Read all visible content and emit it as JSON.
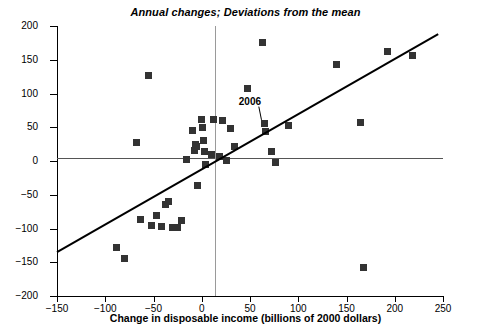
{
  "chart_data": {
    "type": "scatter",
    "title": "Annual changes; Deviations from the mean",
    "xlabel": "Change in disposable income (billions of 2000 dollars)",
    "ylabel": "Change in consumption (billions of 2000 dollars)",
    "xlim": [
      -150,
      250
    ],
    "ylim": [
      -200,
      200
    ],
    "xticks": [
      -150,
      -100,
      -50,
      0,
      50,
      100,
      150,
      200,
      250
    ],
    "yticks": [
      -200,
      -150,
      -100,
      -50,
      0,
      50,
      100,
      150,
      200
    ],
    "xtick_labels": [
      "−150",
      "−100",
      "−50",
      "0",
      "50",
      "100",
      "150",
      "200",
      "250"
    ],
    "ytick_labels": [
      "−200",
      "−150",
      "−100",
      "−50",
      "0",
      "50",
      "100",
      "150",
      "200"
    ],
    "grid": false,
    "legend": false,
    "zero_lines": {
      "horizontal": 0,
      "vertical": 0
    },
    "points": [
      {
        "x": -88,
        "y": -128
      },
      {
        "x": -80,
        "y": -145
      },
      {
        "x": -68,
        "y": 28
      },
      {
        "x": -63,
        "y": -87
      },
      {
        "x": -55,
        "y": 127
      },
      {
        "x": -52,
        "y": -96
      },
      {
        "x": -47,
        "y": -81
      },
      {
        "x": -42,
        "y": -97
      },
      {
        "x": -38,
        "y": -65
      },
      {
        "x": -34,
        "y": -60
      },
      {
        "x": -30,
        "y": -98
      },
      {
        "x": -25,
        "y": -99
      },
      {
        "x": -21,
        "y": -88
      },
      {
        "x": -16,
        "y": 2
      },
      {
        "x": -10,
        "y": 45
      },
      {
        "x": -8,
        "y": 16
      },
      {
        "x": -6,
        "y": 24
      },
      {
        "x": -5,
        "y": 22
      },
      {
        "x": -4,
        "y": -37
      },
      {
        "x": 0,
        "y": 62
      },
      {
        "x": 1,
        "y": 49
      },
      {
        "x": 2,
        "y": 31
      },
      {
        "x": 3,
        "y": 14
      },
      {
        "x": 4,
        "y": -5
      },
      {
        "x": 10,
        "y": 9
      },
      {
        "x": 12,
        "y": 62
      },
      {
        "x": 18,
        "y": 6
      },
      {
        "x": 22,
        "y": 60
      },
      {
        "x": 26,
        "y": 1
      },
      {
        "x": 30,
        "y": 48
      },
      {
        "x": 34,
        "y": 21
      },
      {
        "x": 47,
        "y": 107
      },
      {
        "x": 63,
        "y": 175
      },
      {
        "x": 65,
        "y": 55
      },
      {
        "x": 66,
        "y": 44
      },
      {
        "x": 72,
        "y": 14
      },
      {
        "x": 76,
        "y": -2
      },
      {
        "x": 90,
        "y": 52
      },
      {
        "x": 140,
        "y": 143
      },
      {
        "x": 165,
        "y": 57
      },
      {
        "x": 168,
        "y": -158
      },
      {
        "x": 192,
        "y": 162
      },
      {
        "x": 218,
        "y": 156
      }
    ],
    "trend_line": {
      "x1": -150,
      "y1": -135,
      "x2": 245,
      "y2": 188
    },
    "annotations": [
      {
        "label": "2006",
        "text_x": 55,
        "text_y": 88,
        "point_x": 65,
        "point_y": 55
      }
    ]
  }
}
